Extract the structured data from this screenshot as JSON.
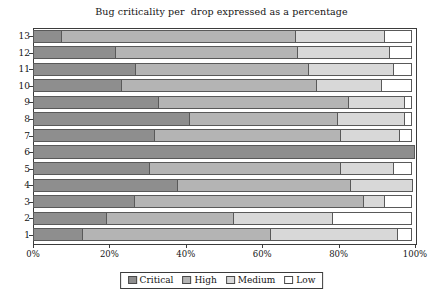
{
  "chart_data": {
    "type": "bar",
    "orientation": "horizontal",
    "stacked": true,
    "normalized_percent": true,
    "title": "Bug criticality per  drop expressed as a percentage",
    "xlabel": "",
    "ylabel": "",
    "xlim": [
      0,
      100
    ],
    "grid": false,
    "legend_position": "bottom",
    "categories": [
      "1",
      "2",
      "3",
      "4",
      "5",
      "6",
      "7",
      "8",
      "9",
      "10",
      "11",
      "12",
      "13"
    ],
    "category_display_order_top_to_bottom": [
      "13",
      "12",
      "11",
      "10",
      "9",
      "8",
      "7",
      "6",
      "5",
      "4",
      "3",
      "2",
      "1"
    ],
    "xtick_labels": [
      "0%",
      "20%",
      "40%",
      "60%",
      "80%",
      "100%"
    ],
    "xtick_values": [
      0,
      20,
      40,
      60,
      80,
      100
    ],
    "series": [
      {
        "name": "Critical",
        "color": "#8e8e8e",
        "values": [
          13.0,
          19.5,
          26.8,
          38.0,
          30.5,
          100.0,
          32.0,
          41.0,
          33.0,
          23.2,
          27.0,
          21.7,
          7.5
        ]
      },
      {
        "name": "High",
        "color": "#b4b4b4",
        "values": [
          49.6,
          33.5,
          60.2,
          45.5,
          50.5,
          0.0,
          49.0,
          39.0,
          50.0,
          51.3,
          45.5,
          47.9,
          61.5
        ]
      },
      {
        "name": "Medium",
        "color": "#d8d8d8",
        "values": [
          33.4,
          26.0,
          5.8,
          16.5,
          14.0,
          0.0,
          15.5,
          18.0,
          15.0,
          17.5,
          22.5,
          24.3,
          23.6
        ]
      },
      {
        "name": "Low",
        "color": "#ffffff",
        "values": [
          4.0,
          21.0,
          7.2,
          0.0,
          5.0,
          0.0,
          3.5,
          2.0,
          2.0,
          8.0,
          5.0,
          6.1,
          7.4
        ]
      }
    ],
    "stack_cumulative_end_percent": {
      "1": {
        "critical": 13.0,
        "high": 62.6,
        "medium": 96.0,
        "low": 100.0
      },
      "2": {
        "critical": 19.5,
        "high": 53.0,
        "medium": 79.0,
        "low": 100.0
      },
      "3": {
        "critical": 26.8,
        "high": 87.0,
        "medium": 92.8,
        "low": 100.0
      },
      "4": {
        "critical": 38.0,
        "high": 83.5,
        "medium": 100.0,
        "low": 100.0
      },
      "5": {
        "critical": 30.5,
        "high": 81.0,
        "medium": 95.0,
        "low": 100.0
      },
      "6": {
        "critical": 100.0,
        "high": 100.0,
        "medium": 100.0,
        "low": 100.0
      },
      "7": {
        "critical": 32.0,
        "high": 81.0,
        "medium": 96.5,
        "low": 100.0
      },
      "8": {
        "critical": 41.0,
        "high": 80.0,
        "medium": 98.0,
        "low": 100.0
      },
      "9": {
        "critical": 33.0,
        "high": 83.0,
        "medium": 98.0,
        "low": 100.0
      },
      "10": {
        "critical": 23.2,
        "high": 74.5,
        "medium": 92.0,
        "low": 100.0
      },
      "11": {
        "critical": 27.0,
        "high": 72.5,
        "medium": 95.0,
        "low": 100.0
      },
      "12": {
        "critical": 21.7,
        "high": 69.6,
        "medium": 93.9,
        "low": 100.0
      },
      "13": {
        "critical": 7.5,
        "high": 69.0,
        "medium": 92.6,
        "low": 100.0
      }
    }
  },
  "legend": {
    "items": [
      {
        "label": "Critical",
        "color": "#8e8e8e"
      },
      {
        "label": "High",
        "color": "#b4b4b4"
      },
      {
        "label": "Medium",
        "color": "#d8d8d8"
      },
      {
        "label": "Low",
        "color": "#ffffff"
      }
    ]
  }
}
